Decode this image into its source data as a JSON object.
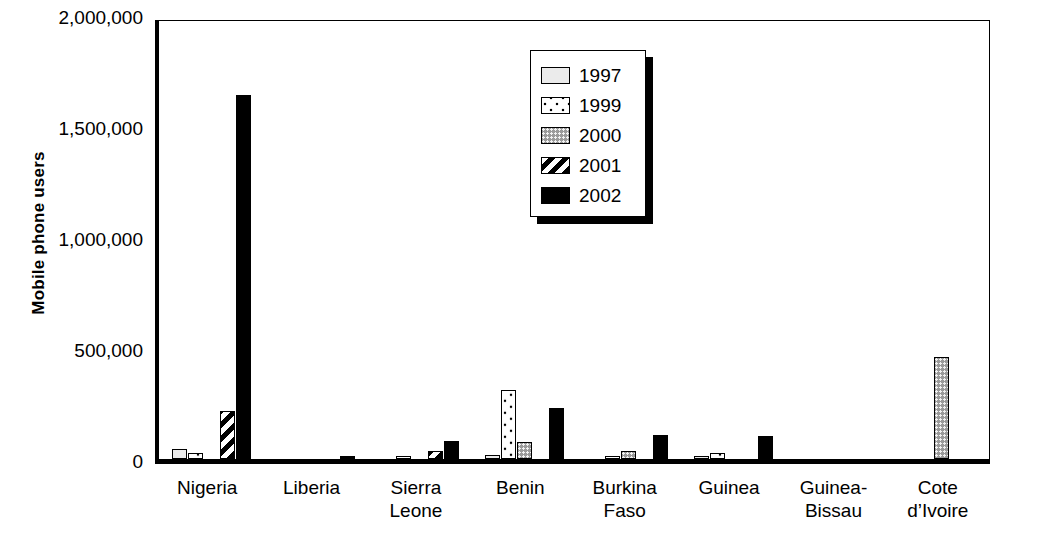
{
  "chart_data": {
    "type": "bar",
    "title": "",
    "xlabel": "",
    "ylabel": "Mobile phone users",
    "ylim": [
      0,
      2000000
    ],
    "yticks": [
      0,
      500000,
      1000000,
      1500000,
      2000000
    ],
    "ytick_labels": [
      "0",
      "500,000",
      "1,000,000",
      "1,500,000",
      "2,000,000"
    ],
    "grid": false,
    "legend_position": "upper-center",
    "categories": [
      "Nigeria",
      "Liberia",
      "Sierra\nLeone",
      "Benin",
      "Burkina\nFaso",
      "Guinea",
      "Guinea-\nBissau",
      "Cote\nd’Ivoire"
    ],
    "series": [
      {
        "name": "1997",
        "pattern": "light-gray-solid",
        "color": "#ebebeb",
        "values": [
          45000,
          0,
          0,
          20000,
          0,
          12000,
          0,
          0
        ]
      },
      {
        "name": "1999",
        "pattern": "white-dotted",
        "color": "#ffffff",
        "values": [
          25000,
          0,
          8000,
          310000,
          8000,
          25000,
          0,
          0
        ]
      },
      {
        "name": "2000",
        "pattern": "gray-stipple",
        "color": "#9a9a9a",
        "values": [
          0,
          0,
          0,
          75000,
          35000,
          0,
          0,
          460000
        ]
      },
      {
        "name": "2001",
        "pattern": "diagonal-hatch",
        "color": "#000000",
        "values": [
          215000,
          0,
          35000,
          0,
          0,
          0,
          0,
          0
        ]
      },
      {
        "name": "2002",
        "pattern": "solid-black",
        "color": "#000000",
        "values": [
          1640000,
          10000,
          80000,
          230000,
          110000,
          105000,
          0,
          0
        ]
      }
    ]
  },
  "legend": {
    "items": [
      {
        "label": "1997"
      },
      {
        "label": "1999"
      },
      {
        "label": "2000"
      },
      {
        "label": "2001"
      },
      {
        "label": "2002"
      }
    ]
  }
}
